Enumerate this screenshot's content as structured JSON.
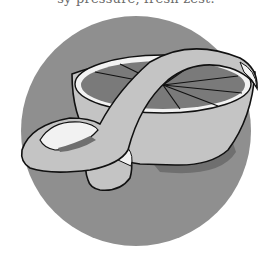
{
  "caption": {
    "text": "sy pressure, fresh zest."
  },
  "illustration": {
    "subject": "grapefruit-half-with-peel-strip",
    "colors": {
      "background_circle": "#8f8f8f",
      "peel": "#c4c4c4",
      "pith": "#f2f2f2",
      "flesh": "#7a7a7a",
      "outline": "#111111",
      "shadow": "#6f6f6f"
    }
  }
}
